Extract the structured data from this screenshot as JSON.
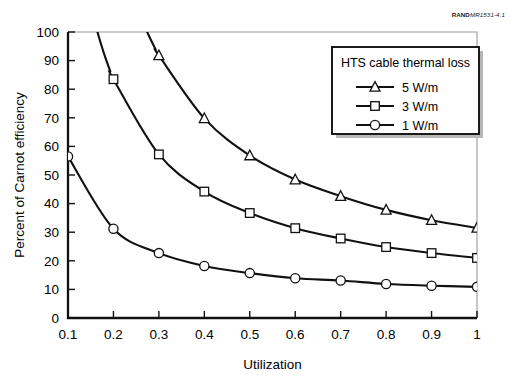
{
  "figure": {
    "source_tag_bold": "RAND",
    "source_tag_italic": "MR1531-4.1"
  },
  "chart_data": {
    "type": "line",
    "title": "",
    "xlabel": "Utilization",
    "ylabel": "Percent of Carnot efficiency",
    "x": [
      0.1,
      0.2,
      0.3,
      0.4,
      0.5,
      0.6,
      0.7,
      0.8,
      0.9,
      1.0
    ],
    "xticklabels": [
      "0.1",
      "0.2",
      "0.3",
      "0.4",
      "0.5",
      "0.6",
      "0.7",
      "0.8",
      "0.9",
      "1"
    ],
    "yticklabels": [
      "0",
      "10",
      "20",
      "30",
      "40",
      "50",
      "60",
      "70",
      "80",
      "90",
      "100"
    ],
    "yticks": [
      0,
      10,
      20,
      30,
      40,
      50,
      60,
      70,
      80,
      90,
      100
    ],
    "xlim": [
      0.1,
      1.0
    ],
    "ylim": [
      0,
      100
    ],
    "grid": false,
    "legend_position": "upper-right",
    "legend_title": "HTS cable thermal loss",
    "series": [
      {
        "name": "5 W/m",
        "marker": "triangle",
        "values": [
          null,
          null,
          91.8,
          69.8,
          56.8,
          48.4,
          42.6,
          37.8,
          34.2,
          31.5
        ]
      },
      {
        "name": "3 W/m",
        "marker": "square",
        "values": [
          null,
          83.5,
          57.2,
          44.2,
          36.7,
          31.4,
          27.8,
          24.8,
          22.7,
          21.0
        ]
      },
      {
        "name": "1 W/m",
        "marker": "circle",
        "values": [
          56.5,
          31.2,
          22.7,
          18.2,
          15.7,
          13.9,
          13.1,
          11.9,
          11.3,
          10.9
        ]
      }
    ]
  }
}
